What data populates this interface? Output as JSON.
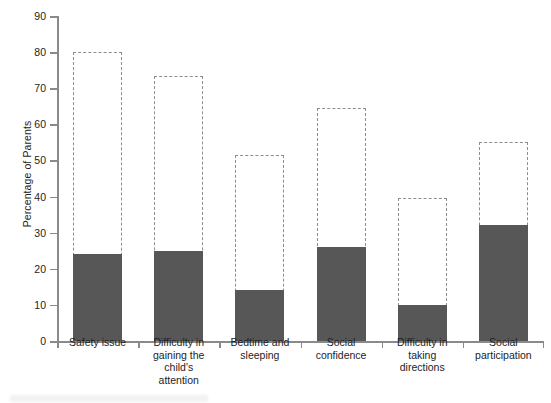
{
  "chart_data": {
    "type": "bar",
    "title": "",
    "xlabel": "",
    "ylabel": "Percentage of Parents",
    "ylim": [
      0,
      90
    ],
    "ytick_step": 10,
    "yticks": [
      0,
      10,
      20,
      30,
      40,
      50,
      60,
      70,
      80,
      90
    ],
    "grid": false,
    "legend": "none",
    "categories": [
      "Safety issue",
      "Difficulty in gaining the child's attention",
      "Bedtime and sleeping",
      "Social confidence",
      "Difficulty in taking directions",
      "Social participation"
    ],
    "category_label_lines": [
      [
        "Safety issue"
      ],
      [
        "Difficulty in",
        "gaining the",
        "child's",
        "attention"
      ],
      [
        "Bedtime and",
        "sleeping"
      ],
      [
        "Social",
        "confidence"
      ],
      [
        "Difficulty in",
        "taking",
        "directions"
      ],
      [
        "Social",
        "participation"
      ]
    ],
    "series": [
      {
        "name": "dashed-outline",
        "style": "dashed-outline",
        "color": "#8d8d8d",
        "values": [
          80,
          73.5,
          51.5,
          64.5,
          39.5,
          55
        ]
      },
      {
        "name": "solid-fill",
        "style": "solid-fill",
        "color": "#575757",
        "values": [
          24,
          25,
          14,
          26,
          10,
          32
        ]
      }
    ]
  },
  "colors": {
    "solid_bar": "#575757",
    "dashed_bar": "#8d8d8d",
    "axis": "#8a8a8a",
    "text": "#1d1d1d",
    "background": "#ffffff"
  }
}
